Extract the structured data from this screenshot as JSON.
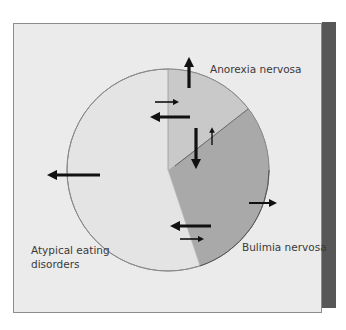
{
  "diagram": {
    "type": "pie-with-arrows",
    "segments": [
      {
        "id": "anorexia",
        "label": "Anorexia nervosa",
        "color": "#c9c9c9",
        "approx_share": 0.17
      },
      {
        "id": "bulimia",
        "label": "Bulimia nervosa",
        "color": "#a9a9a9",
        "approx_share": 0.33
      },
      {
        "id": "atypical",
        "label": "Atypical eating disorders",
        "label_lines": [
          "Atypical eating",
          "disorders"
        ],
        "color": "#e4e4e4",
        "approx_share": 0.5
      }
    ],
    "arrows": [
      {
        "from": "anorexia",
        "direction": "up",
        "meaning": "leaving (outward)",
        "weight": "thick"
      },
      {
        "from": "atypical",
        "to": "anorexia",
        "direction": "right",
        "weight": "thin"
      },
      {
        "from": "anorexia",
        "to": "atypical",
        "direction": "left",
        "weight": "thick"
      },
      {
        "from": "anorexia",
        "to": "bulimia",
        "direction": "down",
        "weight": "thick"
      },
      {
        "from": "bulimia",
        "to": "anorexia",
        "direction": "up",
        "weight": "thin"
      },
      {
        "from": "atypical",
        "direction": "left",
        "meaning": "leaving (outward)",
        "weight": "thick"
      },
      {
        "from": "bulimia",
        "direction": "right",
        "meaning": "leaving (outward)",
        "weight": "medium"
      },
      {
        "from": "bulimia",
        "to": "atypical",
        "direction": "left",
        "weight": "thick"
      },
      {
        "from": "atypical",
        "to": "bulimia",
        "direction": "right",
        "weight": "thin"
      }
    ],
    "colors": {
      "panel_bg": "#ebebeb",
      "panel_border": "#8c8c8c",
      "side_strip": "#575757",
      "circle_outline": "#8a8a8a",
      "arrow": "#111111"
    }
  },
  "labels": {
    "anorexia": "Anorexia nervosa",
    "bulimia": "Bulimia nervosa",
    "atypical_line1": "Atypical eating",
    "atypical_line2": "disorders"
  }
}
